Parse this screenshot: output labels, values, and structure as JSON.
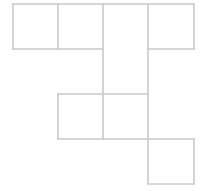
{
  "figure": {
    "kind": "polyomino-net",
    "background_color": "#ffffff",
    "line_color": "#c9c9c9",
    "fill_color": "#ffffff",
    "line_width": 1.6,
    "canvas": {
      "width": 204,
      "height": 191
    },
    "grid": {
      "cell_size": 45,
      "origin_x": 13,
      "origin_y": 4,
      "columns": 4,
      "rows": 4,
      "column_edges_x": [
        13,
        58,
        103,
        148,
        194
      ],
      "row_edges_y": [
        4,
        49,
        94,
        139,
        184
      ]
    },
    "cells": [
      {
        "name": "cell-r1c1",
        "col": 0,
        "row": 0,
        "x": 13,
        "y": 4,
        "w": 45,
        "h": 45
      },
      {
        "name": "cell-r1c2",
        "col": 1,
        "row": 0,
        "x": 58,
        "y": 4,
        "w": 45,
        "h": 45
      },
      {
        "name": "cell-r1c3",
        "col": 2,
        "row": 0,
        "x": 103,
        "y": 4,
        "w": 45,
        "h": 45
      },
      {
        "name": "cell-r1c4",
        "col": 3,
        "row": 0,
        "x": 148,
        "y": 4,
        "w": 46,
        "h": 45
      },
      {
        "name": "cell-r2c3",
        "col": 2,
        "row": 1,
        "x": 103,
        "y": 49,
        "w": 45,
        "h": 45
      },
      {
        "name": "cell-r3c2",
        "col": 1,
        "row": 2,
        "x": 58,
        "y": 94,
        "w": 45,
        "h": 45
      },
      {
        "name": "cell-r3c3",
        "col": 2,
        "row": 2,
        "x": 103,
        "y": 94,
        "w": 45,
        "h": 45
      },
      {
        "name": "cell-r4c4",
        "col": 3,
        "row": 3,
        "x": 148,
        "y": 139,
        "w": 46,
        "h": 45
      }
    ],
    "edges": [
      {
        "name": "edge-top-row1",
        "x1": 13,
        "y1": 4,
        "x2": 194,
        "y2": 4
      },
      {
        "name": "edge-bottom-row1-left",
        "x1": 13,
        "y1": 49,
        "x2": 103,
        "y2": 49
      },
      {
        "name": "edge-bottom-row1-right",
        "x1": 148,
        "y1": 49,
        "x2": 194,
        "y2": 49
      },
      {
        "name": "edge-top-row3",
        "x1": 58,
        "y1": 94,
        "x2": 148,
        "y2": 94
      },
      {
        "name": "edge-bottom-row3",
        "x1": 58,
        "y1": 139,
        "x2": 194,
        "y2": 139
      },
      {
        "name": "edge-bottom-row4",
        "x1": 148,
        "y1": 184,
        "x2": 194,
        "y2": 184
      },
      {
        "name": "edge-left-row1",
        "x1": 13,
        "y1": 4,
        "x2": 13,
        "y2": 49
      },
      {
        "name": "edge-div-col1-col2-row1",
        "x1": 58,
        "y1": 4,
        "x2": 58,
        "y2": 49
      },
      {
        "name": "edge-left-row3",
        "x1": 58,
        "y1": 94,
        "x2": 58,
        "y2": 139
      },
      {
        "name": "edge-col3-left-long",
        "x1": 103,
        "y1": 4,
        "x2": 103,
        "y2": 139
      },
      {
        "name": "edge-col3-right-long",
        "x1": 148,
        "y1": 4,
        "x2": 148,
        "y2": 184
      },
      {
        "name": "edge-right-row1",
        "x1": 194,
        "y1": 4,
        "x2": 194,
        "y2": 49
      },
      {
        "name": "edge-right-row4",
        "x1": 194,
        "y1": 139,
        "x2": 194,
        "y2": 184
      }
    ]
  }
}
